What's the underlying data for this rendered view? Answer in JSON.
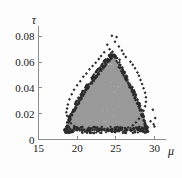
{
  "chart_data": {
    "type": "scatter",
    "title": "",
    "subtitle": "",
    "xlabel": "μ",
    "ylabel": "τ",
    "xlim": [
      15,
      31.5
    ],
    "ylim": [
      0,
      0.088
    ],
    "xticks": [
      15,
      20,
      25,
      30
    ],
    "xticklabels": [
      "15",
      "20",
      "25",
      "30"
    ],
    "yticks": [
      0,
      0.02,
      0.04,
      0.06,
      0.08
    ],
    "yticklabels": [
      "0",
      "0.02",
      "0.04",
      "0.06",
      "0.08"
    ],
    "grid": false,
    "legend": null,
    "annotations": [],
    "colors": {
      "core_points": "#9a9a9a",
      "edge_points": "#2b2b2b",
      "axis": "#8d8d8d",
      "text": "#202020",
      "background": "#fdfdfd"
    },
    "point_style": {
      "core_marker": "circle",
      "core_size_px": 2.6,
      "edge_marker": "diamond",
      "edge_size_px": 2.4
    },
    "cloud_shape": {
      "peak_mu": 24.6,
      "peak_tau": 0.066,
      "base_tau": 0.0075,
      "left_mu": 18.6,
      "right_mu": 28.9
    },
    "core_points": [
      [
        24.6,
        0.0615
      ],
      [
        24.2,
        0.06
      ],
      [
        25.0,
        0.0592
      ],
      [
        23.9,
        0.0575
      ],
      [
        24.8,
        0.057
      ],
      [
        23.6,
        0.0556
      ],
      [
        25.3,
        0.055
      ],
      [
        24.4,
        0.0545
      ],
      [
        23.3,
        0.0533
      ],
      [
        25.6,
        0.0528
      ],
      [
        24.0,
        0.0522
      ],
      [
        24.9,
        0.0518
      ],
      [
        23.0,
        0.051
      ],
      [
        25.9,
        0.0505
      ],
      [
        23.7,
        0.05
      ],
      [
        25.2,
        0.0496
      ],
      [
        22.7,
        0.0488
      ],
      [
        26.2,
        0.0483
      ],
      [
        24.3,
        0.0478
      ],
      [
        23.4,
        0.0472
      ],
      [
        25.5,
        0.0468
      ],
      [
        22.4,
        0.0462
      ],
      [
        26.5,
        0.0458
      ],
      [
        24.7,
        0.0452
      ],
      [
        23.1,
        0.0448
      ],
      [
        25.8,
        0.0443
      ],
      [
        22.1,
        0.0438
      ],
      [
        26.8,
        0.0433
      ],
      [
        24.1,
        0.0428
      ],
      [
        22.8,
        0.0424
      ],
      [
        26.1,
        0.0419
      ],
      [
        21.8,
        0.0414
      ],
      [
        27.0,
        0.041
      ],
      [
        24.5,
        0.0405
      ],
      [
        23.8,
        0.0401
      ],
      [
        25.1,
        0.0396
      ],
      [
        22.5,
        0.0392
      ],
      [
        26.4,
        0.0388
      ],
      [
        21.5,
        0.0383
      ],
      [
        27.3,
        0.0378
      ],
      [
        24.0,
        0.0374
      ],
      [
        23.2,
        0.0369
      ],
      [
        25.7,
        0.0365
      ],
      [
        22.2,
        0.036
      ],
      [
        26.7,
        0.0356
      ],
      [
        21.2,
        0.0351
      ],
      [
        27.5,
        0.0347
      ],
      [
        24.6,
        0.0342
      ],
      [
        23.5,
        0.0338
      ],
      [
        25.4,
        0.0333
      ],
      [
        21.9,
        0.0329
      ],
      [
        26.9,
        0.0324
      ],
      [
        20.9,
        0.032
      ],
      [
        27.7,
        0.0315
      ],
      [
        24.2,
        0.0311
      ],
      [
        23.0,
        0.0306
      ],
      [
        25.9,
        0.0302
      ],
      [
        21.6,
        0.0297
      ],
      [
        27.1,
        0.0293
      ],
      [
        20.6,
        0.0288
      ],
      [
        27.9,
        0.0284
      ],
      [
        24.8,
        0.0279
      ],
      [
        22.7,
        0.0275
      ],
      [
        26.2,
        0.027
      ],
      [
        21.3,
        0.0266
      ],
      [
        27.4,
        0.0261
      ],
      [
        20.3,
        0.0257
      ],
      [
        28.1,
        0.0252
      ],
      [
        24.4,
        0.0248
      ],
      [
        22.4,
        0.0243
      ],
      [
        26.6,
        0.0239
      ],
      [
        21.0,
        0.0234
      ],
      [
        27.8,
        0.023
      ],
      [
        20.0,
        0.0225
      ],
      [
        28.3,
        0.0221
      ],
      [
        24.9,
        0.0216
      ],
      [
        22.1,
        0.0212
      ],
      [
        26.0,
        0.0207
      ],
      [
        20.7,
        0.0203
      ],
      [
        27.2,
        0.0198
      ],
      [
        19.7,
        0.0194
      ],
      [
        28.5,
        0.0189
      ],
      [
        24.1,
        0.0185
      ],
      [
        21.7,
        0.018
      ],
      [
        26.4,
        0.0176
      ],
      [
        20.4,
        0.0171
      ],
      [
        27.6,
        0.0167
      ],
      [
        19.5,
        0.0162
      ],
      [
        28.6,
        0.0158
      ],
      [
        24.7,
        0.0153
      ],
      [
        22.9,
        0.0149
      ],
      [
        25.6,
        0.0144
      ],
      [
        20.1,
        0.014
      ],
      [
        27.0,
        0.0135
      ],
      [
        19.3,
        0.0131
      ],
      [
        28.4,
        0.0126
      ],
      [
        23.8,
        0.0122
      ],
      [
        21.4,
        0.0117
      ],
      [
        26.8,
        0.0113
      ],
      [
        19.8,
        0.0108
      ],
      [
        24.3,
        0.0104
      ],
      [
        22.6,
        0.0099
      ],
      [
        25.9,
        0.0095
      ],
      [
        20.8,
        0.0091
      ],
      [
        27.4,
        0.0088
      ],
      [
        23.1,
        0.0084
      ],
      [
        21.1,
        0.0081
      ],
      [
        26.1,
        0.008
      ],
      [
        24.5,
        0.0078
      ],
      [
        22.3,
        0.0077
      ]
    ],
    "edge_points": [
      [
        24.5,
        0.0805
      ],
      [
        25.1,
        0.0795
      ],
      [
        24.9,
        0.0758
      ],
      [
        23.9,
        0.0735
      ],
      [
        25.4,
        0.0722
      ],
      [
        24.2,
        0.07
      ],
      [
        25.8,
        0.069
      ],
      [
        23.5,
        0.0676
      ],
      [
        26.0,
        0.0662
      ],
      [
        24.8,
        0.0655
      ],
      [
        23.1,
        0.0648
      ],
      [
        26.3,
        0.064
      ],
      [
        22.8,
        0.0624
      ],
      [
        25.5,
        0.0618
      ],
      [
        26.9,
        0.0602
      ],
      [
        22.4,
        0.0596
      ],
      [
        27.2,
        0.058
      ],
      [
        22.0,
        0.057
      ],
      [
        27.5,
        0.0552
      ],
      [
        21.6,
        0.0545
      ],
      [
        27.8,
        0.052
      ],
      [
        21.2,
        0.0512
      ],
      [
        28.0,
        0.0494
      ],
      [
        20.8,
        0.0486
      ],
      [
        28.2,
        0.0462
      ],
      [
        20.4,
        0.0452
      ],
      [
        28.4,
        0.043
      ],
      [
        20.0,
        0.042
      ],
      [
        28.6,
        0.0398
      ],
      [
        19.6,
        0.0386
      ],
      [
        28.8,
        0.0362
      ],
      [
        19.3,
        0.035
      ],
      [
        28.9,
        0.0328
      ],
      [
        19.0,
        0.0312
      ],
      [
        28.9,
        0.0292
      ],
      [
        18.8,
        0.0272
      ],
      [
        28.8,
        0.0258
      ],
      [
        18.7,
        0.024
      ],
      [
        29.8,
        0.023
      ],
      [
        28.6,
        0.0222
      ],
      [
        18.6,
        0.0212
      ],
      [
        28.3,
        0.019
      ],
      [
        18.7,
        0.0184
      ],
      [
        30.1,
        0.0166
      ],
      [
        28.0,
        0.016
      ],
      [
        18.9,
        0.0152
      ],
      [
        29.5,
        0.0142
      ],
      [
        27.6,
        0.0132
      ],
      [
        19.2,
        0.0126
      ],
      [
        29.9,
        0.0118
      ],
      [
        27.2,
        0.011
      ],
      [
        19.6,
        0.0104
      ],
      [
        30.0,
        0.01
      ],
      [
        26.6,
        0.0094
      ],
      [
        20.2,
        0.0088
      ],
      [
        28.8,
        0.0086
      ],
      [
        25.8,
        0.008
      ],
      [
        20.9,
        0.0078
      ],
      [
        27.8,
        0.0076
      ],
      [
        24.9,
        0.0072
      ],
      [
        21.7,
        0.0072
      ],
      [
        26.9,
        0.007
      ],
      [
        23.9,
        0.0068
      ],
      [
        22.6,
        0.0068
      ],
      [
        25.2,
        0.0066
      ],
      [
        23.2,
        0.007
      ],
      [
        26.2,
        0.0072
      ],
      [
        22.0,
        0.0074
      ],
      [
        24.4,
        0.0064
      ],
      [
        21.4,
        0.0082
      ]
    ]
  }
}
